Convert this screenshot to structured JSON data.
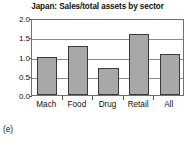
{
  "chart_data": {
    "type": "bar",
    "title": "Japan: Sales/total assets by sector",
    "xlabel": "",
    "ylabel": "",
    "categories": [
      "Mach",
      "Food",
      "Drug",
      "Retail",
      "All"
    ],
    "values": [
      0.98,
      1.28,
      0.7,
      1.58,
      1.06
    ],
    "series": [
      {
        "name": "Sales/total assets",
        "values": [
          0.98,
          1.28,
          0.7,
          1.58,
          1.06
        ]
      }
    ],
    "ylim": [
      0.0,
      2.0
    ],
    "ytick_labels": [
      "0.0",
      "0.5",
      "1.0",
      "1.5",
      "2.0"
    ],
    "ytick_values": [
      0.0,
      0.5,
      1.0,
      1.5,
      2.0
    ],
    "grid": true,
    "legend": false,
    "legend_position": "none",
    "bar_fill_color": "#a8a8a8",
    "bar_border_color": "#3a3a3a",
    "gridline_color": "#8a8a8a",
    "frame_color": "#6f6f6f"
  },
  "caption": {
    "panel_label": "(e)"
  }
}
